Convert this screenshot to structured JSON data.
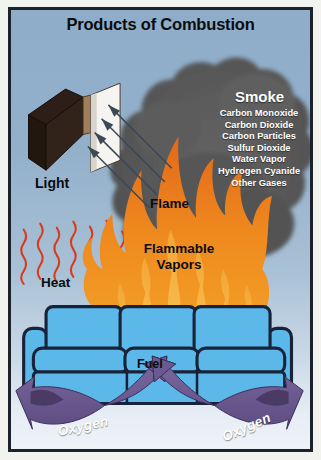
{
  "poster": {
    "title": "Products of Combustion",
    "background_top": "#8fadc9",
    "background_bottom": "#eef3f8",
    "frame_color": "#1b222b"
  },
  "smoke": {
    "heading": "Smoke",
    "color": "#5a5a5a",
    "components": [
      "Carbon Monoxide",
      "Carbon Dioxide",
      "Carbon Particles",
      "Sulfur Dioxide",
      "Water Vapor",
      "Hydrogen Cyanide",
      "Other Gases"
    ]
  },
  "labels": {
    "light": "Light",
    "heat": "Heat",
    "flame": "Flame",
    "flammable_vapors": "Flammable\nVapors",
    "flammable_vapors_line1": "Flammable",
    "flammable_vapors_line2": "Vapors",
    "fuel": "Fuel",
    "oxygen_left": "Oxygen",
    "oxygen_right": "Oxygen"
  },
  "colors": {
    "flame_dark": "#e06c17",
    "flame_mid": "#ef8c1d",
    "flame_light": "#f7b83c",
    "heat_squiggle": "#d93b1a",
    "couch_fill": "#5bb8e8",
    "couch_outline": "#18233a",
    "oxygen_ribbon": "#6b5a8f",
    "oxygen_ribbon_dark": "#4a3a66",
    "block_dark": "#2a1c16",
    "block_face": "#f4f2ee",
    "block_edge": "#9b7d5e",
    "arrow": "#3b4a5a"
  }
}
